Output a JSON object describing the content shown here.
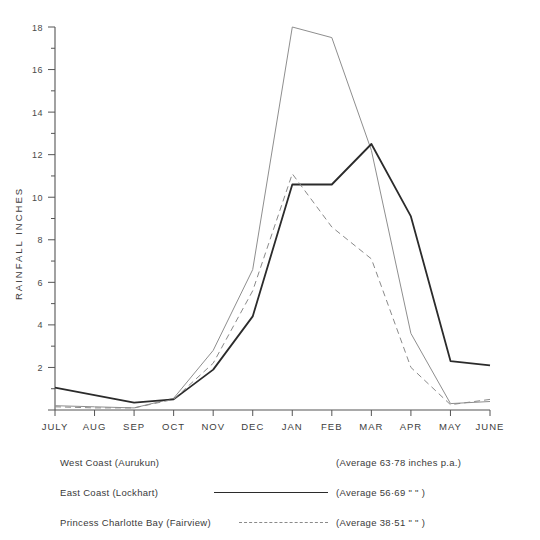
{
  "chart_data": {
    "type": "line",
    "title": "",
    "xlabel": "",
    "ylabel": "RAINFALL   INCHES",
    "categories": [
      "JULY",
      "AUG",
      "SEP",
      "OCT",
      "NOV",
      "DEC",
      "JAN",
      "FEB",
      "MAR",
      "APR",
      "MAY",
      "JUNE"
    ],
    "ylim": [
      0,
      18
    ],
    "ytick_values": [
      0,
      2,
      4,
      6,
      8,
      10,
      12,
      14,
      16,
      18
    ],
    "ytick_labels": [
      "",
      "2",
      "4",
      "6",
      "8",
      "10",
      "12",
      "14",
      "16",
      "18"
    ],
    "yminor_step": 1,
    "grid": false,
    "legend_position": "below",
    "series": [
      {
        "name": "West Coast (Aurukun)",
        "style": "thin-solid",
        "color": "#8e8e8e",
        "average_label": "(Average  63·78 inches  p.a.)",
        "values": [
          0.2,
          0.15,
          0.1,
          0.55,
          2.8,
          6.6,
          18.0,
          17.5,
          12.2,
          3.6,
          0.3,
          0.4
        ]
      },
      {
        "name": "East Coast (Lockhart)",
        "style": "thick-solid",
        "color": "#2b2b2b",
        "average_label": "(Average  56·69   \"        \"  )",
        "values": [
          1.05,
          0.7,
          0.35,
          0.5,
          1.9,
          4.4,
          10.6,
          10.6,
          12.5,
          9.1,
          2.3,
          2.1
        ]
      },
      {
        "name": "Princess Charlotte Bay (Fairview)",
        "style": "dashed",
        "color": "#8a8a8a",
        "average_label": "(Average  38·51    \"        \"  )",
        "values": [
          0.15,
          0.1,
          0.1,
          0.5,
          2.2,
          5.6,
          11.1,
          8.6,
          7.1,
          2.0,
          0.25,
          0.5
        ]
      }
    ]
  },
  "legend": {
    "rows": [
      {
        "name": "West Coast (Aurukun)",
        "average": "(Average  63·78 inches  p.a.)",
        "sample": "none"
      },
      {
        "name": "East Coast (Lockhart)",
        "average": "(Average  56·69    \"          \"  )",
        "sample": "solid"
      },
      {
        "name": "Princess Charlotte Bay (Fairview)",
        "average": "(Average  38·51    \"          \"  )",
        "sample": "dashed"
      }
    ]
  }
}
